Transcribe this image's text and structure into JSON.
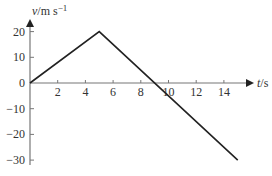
{
  "chart_data": {
    "type": "line",
    "title": "",
    "xlabel": "t/s",
    "ylabel": "v/m s⁻¹",
    "x_ticks": [
      2,
      4,
      6,
      8,
      10,
      12,
      14
    ],
    "y_ticks": [
      20,
      10,
      0,
      -10,
      -20,
      -30
    ],
    "xlim": [
      0,
      15
    ],
    "ylim": [
      -30,
      20
    ],
    "grid": false,
    "legend": null,
    "series": [
      {
        "name": "velocity",
        "x": [
          0,
          5,
          15
        ],
        "y": [
          0,
          20,
          -30
        ]
      }
    ]
  },
  "labels": {
    "xlabel": "t/s",
    "ylabel_v": "v",
    "ylabel_units": "/m s",
    "ylabel_exp": "−1",
    "x_tick_labels": [
      "2",
      "4",
      "6",
      "8",
      "10",
      "12",
      "14"
    ],
    "y_tick_labels": [
      "20",
      "10",
      "0",
      "−10",
      "−20",
      "−30"
    ]
  }
}
